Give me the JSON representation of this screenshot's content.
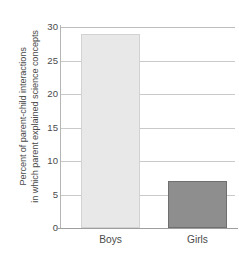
{
  "chart_data": {
    "type": "bar",
    "title": "",
    "subtitle": "",
    "xlabel": "",
    "ylabel_lines": [
      "Percent of parent-child interactions",
      "in which parent explained science concepts"
    ],
    "ylabel": "Percent of parent-child interactions in which parent explained science concepts",
    "categories": [
      "Boys",
      "Girls"
    ],
    "values": [
      29,
      7
    ],
    "ylim": [
      0,
      30
    ],
    "yticks": [
      0,
      5,
      10,
      15,
      20,
      25,
      30
    ],
    "ytick_labels": [
      "0",
      "5",
      "10",
      "15",
      "20",
      "25",
      "30"
    ],
    "grid": true,
    "legend": "none",
    "bar_colors": [
      "#e8e8e8",
      "#8e8e8e"
    ],
    "bar_border_colors": [
      "#d2d2d2",
      "#6f6f6f"
    ],
    "gridline_color": "#c9c9c9",
    "axis_color": "#9e9e9e",
    "text_color": "#4a4a4a",
    "background": "#ffffff"
  }
}
